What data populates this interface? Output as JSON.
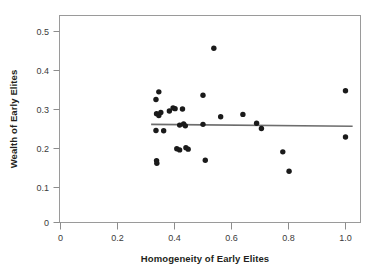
{
  "chart_data": {
    "type": "scatter",
    "title": "",
    "xlabel": "Homogeneity of Early Elites",
    "ylabel": "Wealth of Early Elites",
    "xlim": [
      0,
      1.06
    ],
    "ylim": [
      0,
      0.545
    ],
    "xticks": [
      0,
      0.2,
      0.4,
      0.6,
      0.8,
      1.0
    ],
    "xticklabels": [
      "0",
      "0.2",
      "0.4",
      "0.6",
      "0.8",
      "1.0"
    ],
    "yticks": [
      0,
      0.1,
      0.2,
      0.3,
      0.4,
      0.5
    ],
    "yticklabels": [
      "0",
      "0.1",
      "0.2",
      "0.3",
      "0.4",
      "0.5"
    ],
    "grid": false,
    "legend": null,
    "marker": "filled-circle",
    "marker_color": "#1a1a1a",
    "frame_color": "#9a9a9a",
    "points": [
      {
        "x": 0.335,
        "y": 0.322
      },
      {
        "x": 0.345,
        "y": 0.342
      },
      {
        "x": 0.337,
        "y": 0.285
      },
      {
        "x": 0.345,
        "y": 0.28
      },
      {
        "x": 0.352,
        "y": 0.288
      },
      {
        "x": 0.335,
        "y": 0.241
      },
      {
        "x": 0.362,
        "y": 0.24
      },
      {
        "x": 0.337,
        "y": 0.162
      },
      {
        "x": 0.338,
        "y": 0.155
      },
      {
        "x": 0.382,
        "y": 0.292
      },
      {
        "x": 0.395,
        "y": 0.3
      },
      {
        "x": 0.402,
        "y": 0.298
      },
      {
        "x": 0.428,
        "y": 0.297
      },
      {
        "x": 0.418,
        "y": 0.255
      },
      {
        "x": 0.432,
        "y": 0.258
      },
      {
        "x": 0.438,
        "y": 0.253
      },
      {
        "x": 0.408,
        "y": 0.193
      },
      {
        "x": 0.418,
        "y": 0.19
      },
      {
        "x": 0.44,
        "y": 0.196
      },
      {
        "x": 0.448,
        "y": 0.192
      },
      {
        "x": 0.5,
        "y": 0.333
      },
      {
        "x": 0.5,
        "y": 0.257
      },
      {
        "x": 0.508,
        "y": 0.163
      },
      {
        "x": 0.538,
        "y": 0.456
      },
      {
        "x": 0.562,
        "y": 0.277
      },
      {
        "x": 0.64,
        "y": 0.283
      },
      {
        "x": 0.688,
        "y": 0.26
      },
      {
        "x": 0.705,
        "y": 0.246
      },
      {
        "x": 0.78,
        "y": 0.185
      },
      {
        "x": 0.802,
        "y": 0.134
      },
      {
        "x": 1.0,
        "y": 0.345
      },
      {
        "x": 1.0,
        "y": 0.224
      }
    ],
    "trendline": {
      "label": "linear fit",
      "color": "#6d6d6d",
      "x_start": 0.318,
      "y_start": 0.257,
      "x_end": 1.025,
      "y_end": 0.252
    }
  }
}
